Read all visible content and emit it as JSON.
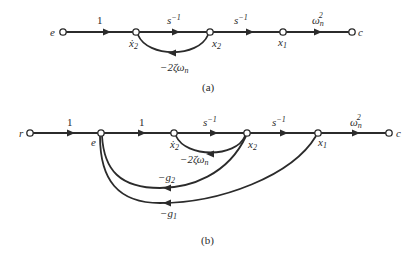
{
  "diagram_a": {
    "caption": "(a)",
    "nodes": {
      "e": "e",
      "x2dot": "ẋ",
      "x2dot_sub": "2",
      "x2": "x",
      "x2_sub": "2",
      "x1": "x",
      "x1_sub": "1",
      "c": "c"
    },
    "edges": {
      "e_to_x2dot": "1",
      "x2dot_to_x2": "s",
      "x2dot_to_x2_sup": "−1",
      "x2_to_x1": "s",
      "x2_to_x1_sup": "−1",
      "x1_to_c": "ω",
      "x1_to_c_sub": "n",
      "x1_to_c_sup": "2",
      "x2_to_x2dot_feedback": "−2ζω",
      "x2_to_x2dot_feedback_sub": "n"
    }
  },
  "diagram_b": {
    "caption": "(b)",
    "nodes": {
      "r": "r",
      "e": "e",
      "x2dot": "ẋ",
      "x2dot_sub": "2",
      "x2": "x",
      "x2_sub": "2",
      "x1": "x",
      "x1_sub": "1",
      "c": "c"
    },
    "edges": {
      "r_to_e": "1",
      "e_to_x2dot": "1",
      "x2dot_to_x2": "s",
      "x2dot_to_x2_sup": "−1",
      "x2_to_x1": "s",
      "x2_to_x1_sup": "−1",
      "x1_to_c": "ω",
      "x1_to_c_sub": "n",
      "x1_to_c_sup": "2",
      "x2_to_x2dot_feedback": "−2ζω",
      "x2_to_x2dot_feedback_sub": "n",
      "x2_to_e_feedback": "−g",
      "x2_to_e_feedback_sub": "2",
      "x1_to_e_feedback": "−g",
      "x1_to_e_feedback_sub": "1"
    }
  }
}
